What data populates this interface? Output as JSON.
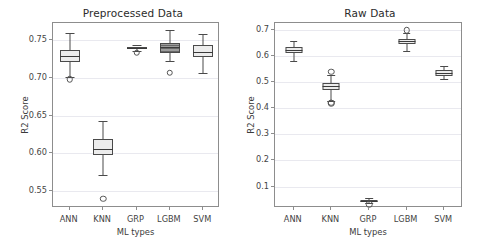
{
  "figure": {
    "width": 484,
    "height": 251,
    "background": "#ffffff",
    "line_color": "#4a4a4a",
    "grid_color": "#e9e9ef",
    "box_fill_light": "#ececec",
    "box_fill_dark": "#9c9c9c"
  },
  "chart_data": [
    {
      "type": "box",
      "id": "preprocessed",
      "title": "Preprocessed Data",
      "xlabel": "ML types",
      "ylabel": "R2 Score",
      "categories": [
        "ANN",
        "KNN",
        "GRP",
        "LGBM",
        "SVM"
      ],
      "yticks": [
        0.55,
        0.6,
        0.65,
        0.7,
        0.75
      ],
      "ytick_labels": [
        "0.55",
        "0.60",
        "0.65",
        "0.70",
        "0.75"
      ],
      "ylim": [
        0.528,
        0.772
      ],
      "grid": true,
      "legend": "none",
      "boxes": [
        {
          "category": "ANN",
          "whisker_low": 0.7005,
          "q1": 0.7205,
          "median": 0.7285,
          "q3": 0.736,
          "whisker_high": 0.7585,
          "fliers": [
            0.6975
          ],
          "fill": "light"
        },
        {
          "category": "KNN",
          "whisker_low": 0.5715,
          "q1": 0.5985,
          "median": 0.6055,
          "q3": 0.6185,
          "whisker_high": 0.6425,
          "fliers": [
            0.54
          ],
          "fill": "light"
        },
        {
          "category": "GRP",
          "whisker_low": 0.735,
          "q1": 0.738,
          "median": 0.7395,
          "q3": 0.741,
          "whisker_high": 0.7435,
          "fliers": [
            0.733
          ],
          "fill": "light"
        },
        {
          "category": "LGBM",
          "whisker_low": 0.7215,
          "q1": 0.7325,
          "median": 0.74,
          "q3": 0.745,
          "whisker_high": 0.7625,
          "fliers": [
            0.7065
          ],
          "fill": "dark"
        },
        {
          "category": "SVM",
          "whisker_low": 0.7065,
          "q1": 0.727,
          "median": 0.7335,
          "q3": 0.7425,
          "whisker_high": 0.758,
          "fliers": [],
          "fill": "light"
        }
      ]
    },
    {
      "type": "box",
      "id": "raw",
      "title": "Raw Data",
      "xlabel": "ML types",
      "ylabel": "R2 Score",
      "categories": [
        "ANN",
        "KNN",
        "GRP",
        "LGBM",
        "SVM"
      ],
      "yticks": [
        0.1,
        0.2,
        0.3,
        0.4,
        0.5,
        0.6,
        0.7
      ],
      "ytick_labels": [
        "0.1",
        "0.2",
        "0.3",
        "0.4",
        "0.5",
        "0.6",
        "0.7"
      ],
      "ylim": [
        0.018,
        0.726
      ],
      "grid": true,
      "legend": "none",
      "boxes": [
        {
          "category": "ANN",
          "whisker_low": 0.58,
          "q1": 0.6125,
          "median": 0.6245,
          "q3": 0.6335,
          "whisker_high": 0.658,
          "fliers": [],
          "fill": "light"
        },
        {
          "category": "KNN",
          "whisker_low": 0.429,
          "q1": 0.471,
          "median": 0.4855,
          "q3": 0.4965,
          "whisker_high": 0.527,
          "fliers": [
            0.54,
            0.4185,
            0.4215
          ],
          "fill": "light"
        },
        {
          "category": "GRP",
          "whisker_low": 0.036,
          "q1": 0.043,
          "median": 0.0465,
          "q3": 0.049,
          "whisker_high": 0.0555,
          "fliers": [
            0.033
          ],
          "fill": "light"
        },
        {
          "category": "LGBM",
          "whisker_low": 0.6195,
          "q1": 0.6455,
          "median": 0.6555,
          "q3": 0.665,
          "whisker_high": 0.688,
          "fliers": [
            0.6985
          ],
          "fill": "light"
        },
        {
          "category": "SVM",
          "whisker_low": 0.5115,
          "q1": 0.525,
          "median": 0.5355,
          "q3": 0.546,
          "whisker_high": 0.561,
          "fliers": [],
          "fill": "light"
        }
      ]
    }
  ]
}
